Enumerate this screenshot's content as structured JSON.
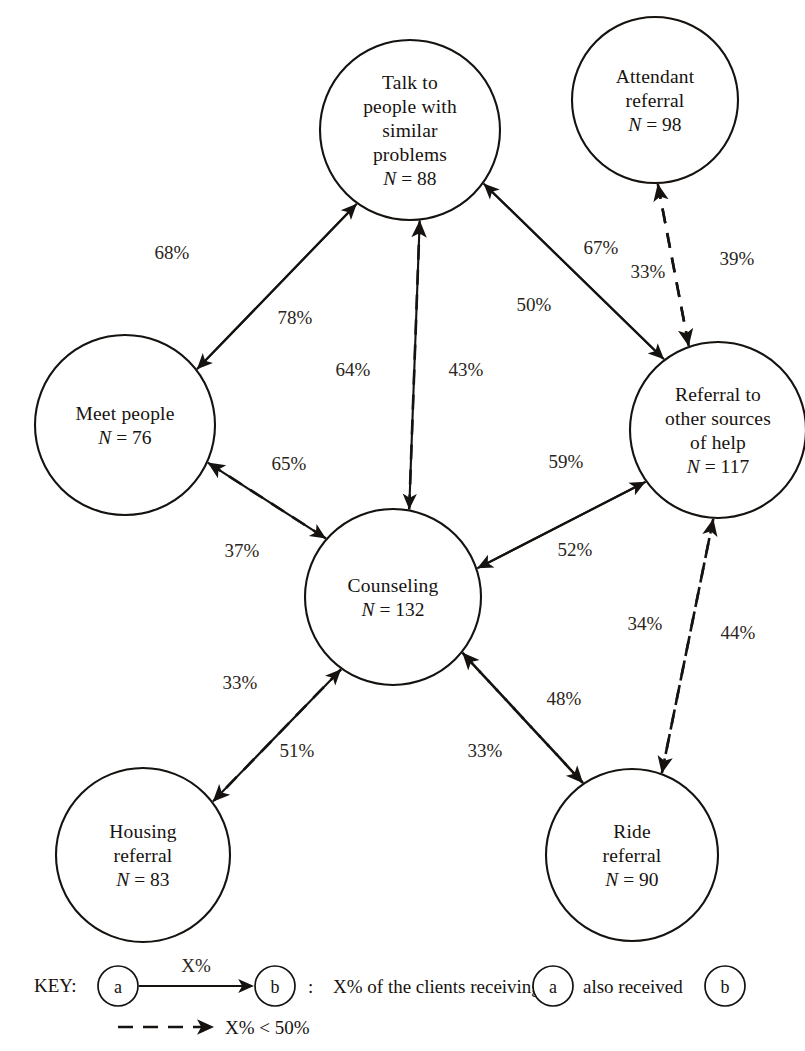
{
  "chart_data": {
    "type": "diagram",
    "nodes": [
      {
        "id": "talk",
        "label_lines": [
          "Talk to",
          "people with",
          "similar",
          "problems"
        ],
        "n_prefix": "N",
        "n_value": "88",
        "cx": 410,
        "cy": 130,
        "r": 90
      },
      {
        "id": "attendant",
        "label_lines": [
          "Attendant",
          "referral"
        ],
        "n_prefix": "N",
        "n_value": "98",
        "cx": 655,
        "cy": 100,
        "r": 83
      },
      {
        "id": "meet",
        "label_lines": [
          "Meet people"
        ],
        "n_prefix": "N",
        "n_value": "76",
        "cx": 125,
        "cy": 425,
        "r": 90
      },
      {
        "id": "referral",
        "label_lines": [
          "Referral to",
          "other sources",
          "of help"
        ],
        "n_prefix": "N",
        "n_value": "117",
        "cx": 718,
        "cy": 430,
        "r": 88
      },
      {
        "id": "counseling",
        "label_lines": [
          "Counseling"
        ],
        "n_prefix": "N",
        "n_value": "132",
        "cx": 393,
        "cy": 597,
        "r": 88
      },
      {
        "id": "housing",
        "label_lines": [
          "Housing",
          "referral"
        ],
        "n_prefix": "N",
        "n_value": "83",
        "cx": 143,
        "cy": 855,
        "r": 87
      },
      {
        "id": "ride",
        "label_lines": [
          "Ride",
          "referral"
        ],
        "n_prefix": "N",
        "n_value": "90",
        "cx": 632,
        "cy": 855,
        "r": 86
      }
    ],
    "edges": [
      {
        "from": "talk",
        "to": "meet",
        "value": "68%",
        "style": "solid",
        "label_x": 172,
        "label_y": 259
      },
      {
        "from": "meet",
        "to": "talk",
        "value": "78%",
        "style": "solid",
        "label_x": 295,
        "label_y": 324
      },
      {
        "from": "talk",
        "to": "counseling",
        "value": "64%",
        "style": "solid",
        "label_x": 353,
        "label_y": 376
      },
      {
        "from": "counseling",
        "to": "talk",
        "value": "43%",
        "style": "dashed",
        "label_x": 466,
        "label_y": 376
      },
      {
        "from": "talk",
        "to": "referral",
        "value": "67%",
        "style": "solid",
        "label_x": 601,
        "label_y": 254
      },
      {
        "from": "referral",
        "to": "talk",
        "value": "50%",
        "style": "solid",
        "label_x": 534,
        "label_y": 311
      },
      {
        "from": "referral",
        "to": "attendant",
        "value": "33%",
        "style": "dashed",
        "label_x": 648,
        "label_y": 278
      },
      {
        "from": "attendant",
        "to": "referral",
        "value": "39%",
        "style": "dashed",
        "label_x": 737,
        "label_y": 265
      },
      {
        "from": "meet",
        "to": "counseling",
        "value": "65%",
        "style": "solid",
        "label_x": 289,
        "label_y": 470
      },
      {
        "from": "counseling",
        "to": "meet",
        "value": "37%",
        "style": "dashed",
        "label_x": 242,
        "label_y": 557
      },
      {
        "from": "referral",
        "to": "counseling",
        "value": "59%",
        "style": "solid",
        "label_x": 566,
        "label_y": 468
      },
      {
        "from": "counseling",
        "to": "referral",
        "value": "52%",
        "style": "solid",
        "label_x": 575,
        "label_y": 556
      },
      {
        "from": "counseling",
        "to": "housing",
        "value": "33%",
        "style": "dashed",
        "label_x": 240,
        "label_y": 689
      },
      {
        "from": "housing",
        "to": "counseling",
        "value": "51%",
        "style": "solid",
        "label_x": 297,
        "label_y": 757
      },
      {
        "from": "counseling",
        "to": "ride",
        "value": "33%",
        "style": "dashed",
        "label_x": 485,
        "label_y": 757
      },
      {
        "from": "ride",
        "to": "counseling",
        "value": "48%",
        "style": "dashed",
        "label_x": 564,
        "label_y": 705
      },
      {
        "from": "referral",
        "to": "ride",
        "value": "34%",
        "style": "dashed",
        "label_x": 645,
        "label_y": 630
      },
      {
        "from": "ride",
        "to": "referral",
        "value": "44%",
        "style": "dashed",
        "label_x": 738,
        "label_y": 639
      }
    ]
  },
  "key": {
    "title": "KEY:",
    "node_a": "a",
    "node_b": "b",
    "edge_value": "X%",
    "colon": ":",
    "definition_part1": "X% of the clients receiving",
    "definition_part2": "also received",
    "dashed_note": "X% < 50%"
  },
  "colors": {
    "ink": "#15120f",
    "background": "#ffffff",
    "label_ink": "#2a2520"
  }
}
